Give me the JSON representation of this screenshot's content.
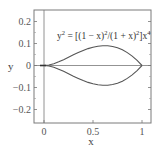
{
  "chart_data": {
    "type": "line",
    "title": "",
    "annotation": "y² = [(1 − x)²/(1 + x)²]x⁴",
    "annotation_parts": {
      "lhs": "y",
      "lhs_exp": "2",
      "rhs1": " = [(1 − x)",
      "e1": "2",
      "rhs2": "/(1 + x)",
      "e2": "2",
      "rhs3": "]x",
      "e3": "4"
    },
    "xlabel": "x",
    "ylabel": "y",
    "xlim": [
      -0.1,
      1.1
    ],
    "ylim": [
      -0.25,
      0.25
    ],
    "xticks": [
      0,
      0.5,
      1
    ],
    "xtick_labels": [
      "0",
      "0.5",
      "1"
    ],
    "yticks": [
      0.2,
      0.1,
      0,
      -0.1,
      -0.2
    ],
    "ytick_labels": [
      "0.2",
      "0.1",
      "0",
      "−0.1",
      "−0.2"
    ],
    "grid": false,
    "reference_lines": {
      "x0": true,
      "y0": true
    },
    "series": [
      {
        "name": "upper branch y = x²(1−x)/(1+x)",
        "x": [
          0,
          0.05,
          0.1,
          0.15,
          0.2,
          0.25,
          0.3,
          0.35,
          0.4,
          0.45,
          0.5,
          0.55,
          0.6,
          0.65,
          0.7,
          0.75,
          0.8,
          0.85,
          0.9,
          0.95,
          1.0
        ],
        "values": [
          0,
          0.0023,
          0.0082,
          0.0166,
          0.0267,
          0.0375,
          0.0485,
          0.0588,
          0.0686,
          0.0768,
          0.0833,
          0.0878,
          0.09,
          0.0896,
          0.0865,
          0.0804,
          0.0711,
          0.0585,
          0.0426,
          0.0231,
          0
        ]
      },
      {
        "name": "lower branch y = −x²(1−x)/(1+x)",
        "x": [
          0,
          0.05,
          0.1,
          0.15,
          0.2,
          0.25,
          0.3,
          0.35,
          0.4,
          0.45,
          0.5,
          0.55,
          0.6,
          0.65,
          0.7,
          0.75,
          0.8,
          0.85,
          0.9,
          0.95,
          1.0
        ],
        "values": [
          0,
          -0.0023,
          -0.0082,
          -0.0166,
          -0.0267,
          -0.0375,
          -0.0485,
          -0.0588,
          -0.0686,
          -0.0768,
          -0.0833,
          -0.0878,
          -0.09,
          -0.0896,
          -0.0865,
          -0.0804,
          -0.0711,
          -0.0585,
          -0.0426,
          -0.0231,
          0
        ]
      }
    ],
    "colors": {
      "line": "#555555",
      "frame": "#777777",
      "text": "#555555"
    }
  }
}
